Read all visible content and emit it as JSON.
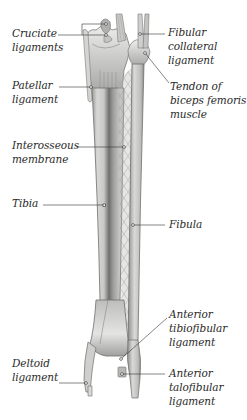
{
  "diagram": {
    "colors": {
      "background": "#ffffff",
      "bone_light": "#e2e2e0",
      "bone_mid": "#b8b8b6",
      "bone_dark": "#7d7d7b",
      "label_text": "#2a2a2a",
      "leader_line": "#333333"
    },
    "labels": {
      "cruciate": "Cruciate\nligaments",
      "patellar": "Patellar\nligament",
      "interosseous": "Interosseous\nmembrane",
      "tibia": "Tibia",
      "deltoid": "Deltoid\nligament",
      "fibular_collateral": "Fibular\ncollateral\nligament",
      "biceps_tendon": "Tendon of\nbiceps femoris\nmuscle",
      "fibula": "Fibula",
      "ant_tibiofibular": "Anterior\ntibiofibular\nligament",
      "ant_talofibular": "Anterior\ntalofibular\nligament"
    }
  }
}
